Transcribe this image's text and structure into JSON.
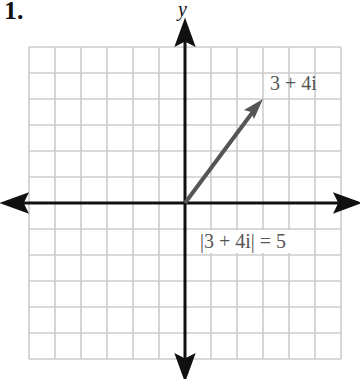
{
  "problem_number": "1.",
  "axes": {
    "y_label": "y"
  },
  "grid": {
    "cells_x": 12,
    "cells_y": 12,
    "cell_px": 26,
    "color": "#cccccc"
  },
  "vector": {
    "label": "3 + 4i",
    "x": 3,
    "y": 4,
    "color": "#555555"
  },
  "modulus": {
    "label": "|3 + 4i| = 5",
    "value": 5
  },
  "chart_data": {
    "type": "diagram",
    "title": "",
    "points": [
      {
        "label": "3 + 4i",
        "re": 3,
        "im": 4
      }
    ],
    "annotations": [
      "3 + 4i",
      "|3 + 4i| = 5"
    ],
    "xlim": [
      -6,
      6
    ],
    "ylim": [
      -6,
      6
    ],
    "grid": true
  }
}
